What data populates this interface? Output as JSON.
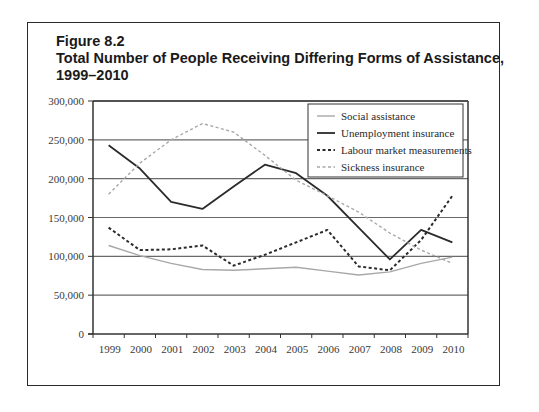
{
  "figure": {
    "label": "Figure 8.2",
    "title_line1": "Total Number of People Receiving Differing Forms of Assistance,",
    "title_line2": "1999–2010"
  },
  "chart_data": {
    "type": "line",
    "title": "Total Number of People Receiving Differing Forms of Assistance, 1999–2010",
    "xlabel": "",
    "ylabel": "",
    "ylim": [
      0,
      300000
    ],
    "yticks": [
      0,
      50000,
      100000,
      150000,
      200000,
      250000,
      300000
    ],
    "ytick_labels": [
      "0",
      "50,000",
      "100,000",
      "150,000",
      "200,000",
      "250,000",
      "300,000"
    ],
    "grid": "horizontal",
    "legend_position": "upper right (inside)",
    "categories": [
      "1999",
      "2000",
      "2001",
      "2002",
      "2003",
      "2004",
      "2005",
      "2006",
      "2007",
      "2008",
      "2009",
      "2010"
    ],
    "series": [
      {
        "name": "Social assistance",
        "style": "solid",
        "color": "#a8a8a8",
        "width": 1.4,
        "values": [
          114000,
          101000,
          91000,
          83000,
          82000,
          84000,
          86000,
          81000,
          76000,
          80000,
          91000,
          99000
        ]
      },
      {
        "name": "Unemployment insurance",
        "style": "solid",
        "color": "#2b2b2b",
        "width": 1.8,
        "values": [
          243000,
          213000,
          170000,
          161000,
          190000,
          218000,
          207000,
          178000,
          137000,
          96000,
          134000,
          118000
        ]
      },
      {
        "name": "Labour market measurements",
        "style": "dashed",
        "color": "#2b2b2b",
        "width": 2,
        "values": [
          137000,
          108000,
          109000,
          114000,
          88000,
          102000,
          118000,
          134000,
          87000,
          82000,
          121000,
          178000
        ]
      },
      {
        "name": "Sickness insurance",
        "style": "dashed",
        "color": "#a8a8a8",
        "width": 1.4,
        "values": [
          180000,
          220000,
          250000,
          271000,
          260000,
          230000,
          198000,
          178000,
          157000,
          130000,
          108000,
          91000
        ]
      }
    ]
  }
}
